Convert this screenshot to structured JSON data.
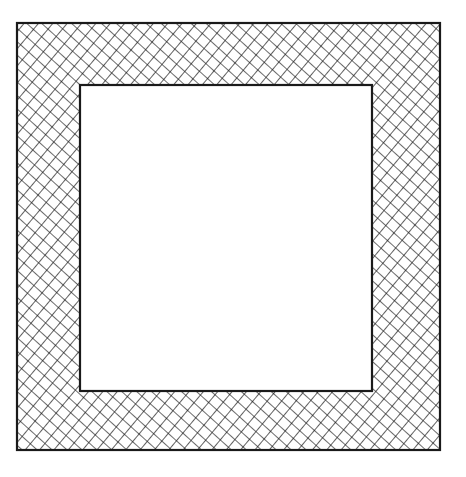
{
  "figure": {
    "outer_square": {
      "x": 17,
      "y": 23,
      "width": 423,
      "height": 427
    },
    "inner_square": {
      "x": 80,
      "y": 85,
      "width": 292,
      "height": 306
    },
    "stroke_color": "#1a1a1a",
    "fill_color": "#ffffff",
    "hatch_pattern": "diagonal-crosshatch"
  },
  "caption": {
    "text": ""
  }
}
